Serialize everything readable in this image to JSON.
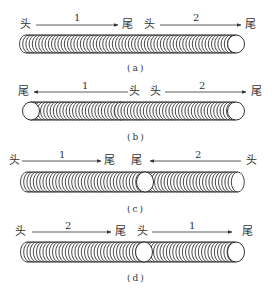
{
  "labels": {
    "head": "头",
    "tail": "尾"
  },
  "panels": [
    {
      "id": "a",
      "caption": "(a)",
      "segments": [
        {
          "number": "1",
          "from": "头",
          "to": "尾",
          "direction": "right"
        },
        {
          "number": "2",
          "from": "头",
          "to": "尾",
          "direction": "right"
        }
      ]
    },
    {
      "id": "b",
      "caption": "(b)",
      "segments": [
        {
          "number": "1",
          "from": "头",
          "to": "尾",
          "direction": "left"
        },
        {
          "number": "2",
          "from": "头",
          "to": "尾",
          "direction": "right"
        }
      ]
    },
    {
      "id": "c",
      "caption": "(c)",
      "segments": [
        {
          "number": "1",
          "from": "头",
          "to": "尾",
          "direction": "right"
        },
        {
          "number": "2",
          "from": "头",
          "to": "尾",
          "direction": "left"
        }
      ]
    },
    {
      "id": "d",
      "caption": "(d)",
      "segments": [
        {
          "number": "2",
          "from": "头",
          "to": "尾",
          "direction": "right"
        },
        {
          "number": "1",
          "from": "头",
          "to": "尾",
          "direction": "right"
        }
      ]
    }
  ],
  "colors": {
    "line": "#333333",
    "background": "#ffffff"
  }
}
